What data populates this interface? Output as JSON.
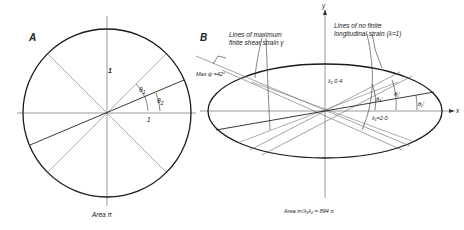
{
  "panel_a": {
    "label": "A",
    "radius_label": "1",
    "x_unit_label": "1",
    "theta1": "θ",
    "theta1_sub": "1",
    "theta2": "θ",
    "theta2_sub": "2",
    "area_label": "Area  π"
  },
  "panel_b": {
    "label": "B",
    "y_axis": "y",
    "x_axis": "x",
    "shear_annotation_line1": "Lines of maximum",
    "shear_annotation_line2": "finite shear strain γ",
    "no_strain_annotation_line1": "Lines of no finite",
    "no_strain_annotation_line2": "longitudinal strain (λ=1)",
    "max_psi": "Max ψ =42°",
    "psi_symbol": "ψ",
    "lambda2": "λ₂ 0·4",
    "lambda1": "λ₁=2·0",
    "theta1p": "θ₁′",
    "theta2p": "θ₂′",
    "theta3p": "θ₃′",
    "area_label": "Area  π√λ₁λ₂ =·894 π"
  },
  "colors": {
    "ink": "#1a1a1a",
    "thin": "#555555",
    "background": "#ffffff"
  }
}
